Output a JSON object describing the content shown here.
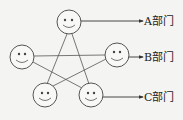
{
  "diagram": {
    "type": "network",
    "nodes": [
      {
        "id": "top",
        "cx": 69,
        "cy": 22,
        "icon": "smiley-face-icon"
      },
      {
        "id": "left",
        "cx": 22,
        "cy": 57,
        "icon": "smiley-face-icon"
      },
      {
        "id": "right",
        "cx": 117,
        "cy": 55,
        "icon": "smiley-face-icon"
      },
      {
        "id": "bottom-left",
        "cx": 45,
        "cy": 95,
        "icon": "smiley-face-icon"
      },
      {
        "id": "bottom-right",
        "cx": 91,
        "cy": 95,
        "icon": "smiley-face-icon"
      }
    ],
    "edges": [
      [
        "top",
        "bottom-left"
      ],
      [
        "top",
        "bottom-right"
      ],
      [
        "left",
        "right"
      ],
      [
        "left",
        "bottom-right"
      ],
      [
        "right",
        "bottom-left"
      ]
    ],
    "labels": {
      "a": "A部门",
      "b": "B部门",
      "c": "C部门"
    }
  }
}
